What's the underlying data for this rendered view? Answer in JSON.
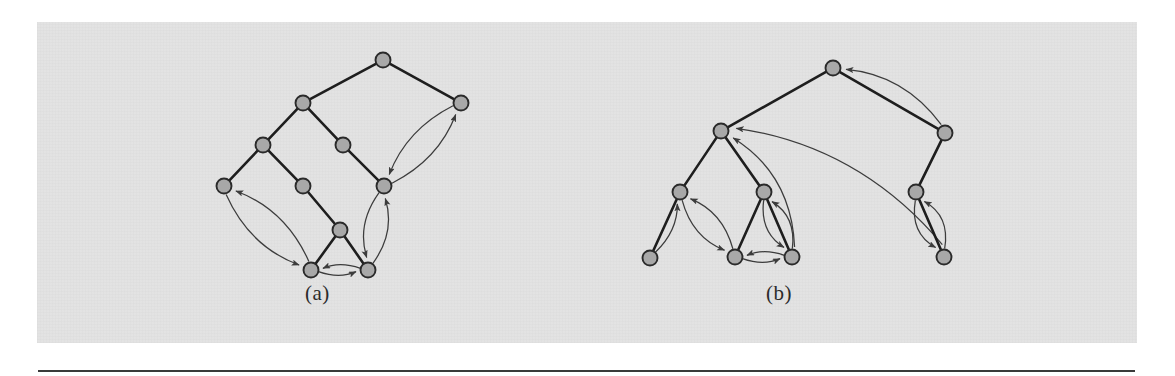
{
  "figure": {
    "background_color": "#e2e2e2",
    "page_color": "#ffffff",
    "node_fill": "#a8a8a8",
    "node_stroke": "#2a2a2a",
    "tree_edge_color": "#1e1e1e",
    "back_edge_color": "#3c3c3c",
    "rule_color": "#3a3a3a",
    "panel": {
      "x": 37,
      "y": 22,
      "width": 1100,
      "height": 321
    },
    "rule": {
      "x": 38,
      "y": 370,
      "width": 1097,
      "height": 2
    }
  },
  "captions": {
    "a": "(a)",
    "b": "(b)"
  },
  "chart_data": {
    "type": "diagram",
    "title": "",
    "subtitle": "",
    "diagrams": [
      {
        "id": "a",
        "label": "(a)",
        "label_position": {
          "x": 320,
          "y": 296
        },
        "node_radius": 7.5,
        "nodes": [
          {
            "id": "a1",
            "x": 383,
            "y": 60
          },
          {
            "id": "a2",
            "x": 303,
            "y": 103
          },
          {
            "id": "a3",
            "x": 461,
            "y": 103
          },
          {
            "id": "a4",
            "x": 263,
            "y": 145
          },
          {
            "id": "a5",
            "x": 343,
            "y": 145
          },
          {
            "id": "a6",
            "x": 224,
            "y": 186
          },
          {
            "id": "a7",
            "x": 303,
            "y": 186
          },
          {
            "id": "a8",
            "x": 384,
            "y": 186
          },
          {
            "id": "a9",
            "x": 340,
            "y": 230
          },
          {
            "id": "a10",
            "x": 311,
            "y": 270
          },
          {
            "id": "a11",
            "x": 368,
            "y": 270
          }
        ],
        "tree_edges": [
          [
            "a1",
            "a2"
          ],
          [
            "a1",
            "a3"
          ],
          [
            "a2",
            "a4"
          ],
          [
            "a2",
            "a5"
          ],
          [
            "a4",
            "a6"
          ],
          [
            "a4",
            "a7"
          ],
          [
            "a5",
            "a8"
          ],
          [
            "a7",
            "a9"
          ],
          [
            "a9",
            "a10"
          ],
          [
            "a9",
            "a11"
          ]
        ],
        "back_edges": [
          {
            "from": "a8",
            "to": "a3",
            "bow": 22
          },
          {
            "from": "a3",
            "to": "a8",
            "bow": 22
          },
          {
            "from": "a10",
            "to": "a6",
            "bow": 26
          },
          {
            "from": "a6",
            "to": "a10",
            "bow": 26
          },
          {
            "from": "a11",
            "to": "a8",
            "bow": 20
          },
          {
            "from": "a8",
            "to": "a11",
            "bow": 20
          },
          {
            "from": "a11",
            "to": "a10",
            "bow": 9
          },
          {
            "from": "a10",
            "to": "a11",
            "bow": 9
          }
        ]
      },
      {
        "id": "b",
        "label": "(b)",
        "label_position": {
          "x": 781,
          "y": 296
        },
        "node_radius": 7.5,
        "nodes": [
          {
            "id": "b1",
            "x": 833,
            "y": 68
          },
          {
            "id": "b2",
            "x": 721,
            "y": 131
          },
          {
            "id": "b3",
            "x": 945,
            "y": 133
          },
          {
            "id": "b4",
            "x": 680,
            "y": 192
          },
          {
            "id": "b5",
            "x": 764,
            "y": 192
          },
          {
            "id": "b6",
            "x": 916,
            "y": 192
          },
          {
            "id": "b7",
            "x": 650,
            "y": 258
          },
          {
            "id": "b8",
            "x": 735,
            "y": 257
          },
          {
            "id": "b9",
            "x": 792,
            "y": 257
          },
          {
            "id": "b10",
            "x": 944,
            "y": 257
          }
        ],
        "tree_edges": [
          [
            "b1",
            "b2"
          ],
          [
            "b1",
            "b3"
          ],
          [
            "b2",
            "b4"
          ],
          [
            "b2",
            "b5"
          ],
          [
            "b3",
            "b6"
          ],
          [
            "b4",
            "b7"
          ],
          [
            "b5",
            "b8"
          ],
          [
            "b5",
            "b9"
          ],
          [
            "b6",
            "b10"
          ]
        ],
        "back_edges": [
          {
            "from": "b3",
            "to": "b1",
            "bow": 30
          },
          {
            "from": "b9",
            "to": "b2",
            "bow": 40
          },
          {
            "from": "b7",
            "to": "b4",
            "bow": 14
          },
          {
            "from": "b8",
            "to": "b4",
            "bow": 20
          },
          {
            "from": "b4",
            "to": "b8",
            "bow": 20
          },
          {
            "from": "b9",
            "to": "b5",
            "bow": 20
          },
          {
            "from": "b5",
            "to": "b9",
            "bow": 20
          },
          {
            "from": "b9",
            "to": "b8",
            "bow": 9
          },
          {
            "from": "b8",
            "to": "b9",
            "bow": 9
          },
          {
            "from": "b10",
            "to": "b6",
            "bow": 22
          },
          {
            "from": "b6",
            "to": "b10",
            "bow": 22
          },
          {
            "from": "b10",
            "to": "b2",
            "bow": 55
          }
        ]
      }
    ]
  }
}
